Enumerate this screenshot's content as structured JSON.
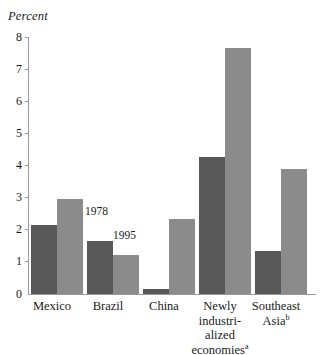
{
  "chart_data": {
    "type": "bar",
    "title": "",
    "subtitle": "",
    "xlabel": "",
    "ylabel": "Percent",
    "ylim": [
      0,
      8
    ],
    "yticks": [
      0,
      1,
      2,
      3,
      4,
      5,
      6,
      7,
      8
    ],
    "ytick_labels": [
      "0",
      "1",
      "2",
      "3",
      "4",
      "5",
      "6",
      "7",
      "8"
    ],
    "grid": false,
    "legend_position": "in-plot-annotation",
    "categories": [
      "Mexico",
      "Brazil",
      "China",
      "Newly industri-alized economiesᵃ",
      "Southeast Asiaᵇ"
    ],
    "series": [
      {
        "name": "1978",
        "color": "#585858",
        "values": [
          2.15,
          1.65,
          0.15,
          4.25,
          1.35
        ]
      },
      {
        "name": "1995",
        "color": "#8b8b8b",
        "values": [
          2.95,
          1.2,
          2.35,
          7.65,
          3.9
        ]
      }
    ],
    "annotations": [
      {
        "text": "1978",
        "series": "1978",
        "category": "Brazil"
      },
      {
        "text": "1995",
        "series": "1995",
        "category": "Brazil"
      }
    ]
  },
  "axis": {
    "y_title": "Percent",
    "ticks": [
      {
        "value": "8"
      },
      {
        "value": "7"
      },
      {
        "value": "6"
      },
      {
        "value": "5"
      },
      {
        "value": "4"
      },
      {
        "value": "3"
      },
      {
        "value": "2"
      },
      {
        "value": "1"
      },
      {
        "value": "0"
      }
    ]
  },
  "categories": [
    {
      "line1": "Mexico",
      "line2": "",
      "line3": "",
      "line4": "",
      "sup": ""
    },
    {
      "line1": "Brazil",
      "line2": "",
      "line3": "",
      "line4": "",
      "sup": ""
    },
    {
      "line1": "China",
      "line2": "",
      "line3": "",
      "line4": "",
      "sup": ""
    },
    {
      "line1": "Newly",
      "line2": "industri-",
      "line3": "alized",
      "line4": "economies",
      "sup": "a"
    },
    {
      "line1": "Southeast",
      "line2": "Asia",
      "line3": "",
      "line4": "",
      "sup": "b"
    }
  ],
  "annotations": {
    "a1978": "1978",
    "a1995": "1995"
  },
  "colors": {
    "bar_dark": "#585858",
    "bar_light": "#8b8b8b",
    "axis": "#9a9a9a",
    "text": "#1a1a1a",
    "background": "#ffffff"
  }
}
